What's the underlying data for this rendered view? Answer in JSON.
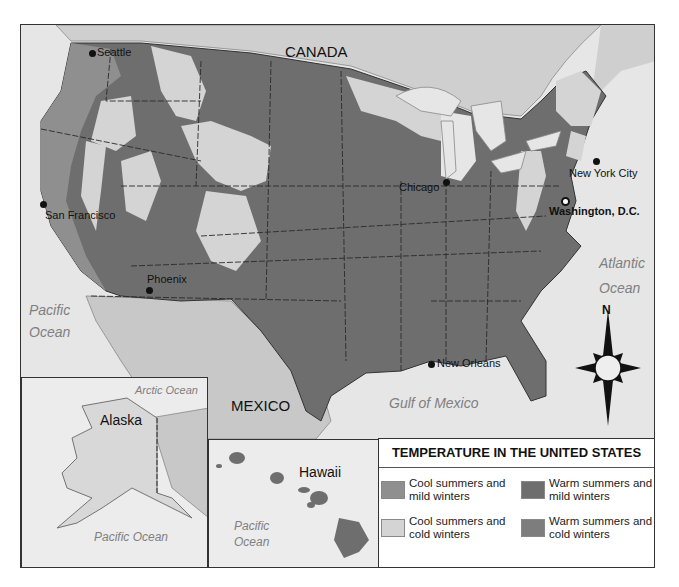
{
  "map": {
    "countries": {
      "canada": "CANADA",
      "mexico": "MEXICO"
    },
    "oceans": {
      "pacific_main": [
        "Pacific",
        "Ocean"
      ],
      "atlantic": [
        "Atlantic",
        "Ocean"
      ],
      "gulf": "Gulf of Mexico",
      "arctic_alaska": "Arctic Ocean",
      "pacific_alaska": "Pacific Ocean",
      "pacific_hawaii": [
        "Pacific",
        "Ocean"
      ]
    },
    "lakes": {
      "superior": "L. Superior",
      "michigan": "L. Michigan",
      "huron": "L. Huron",
      "erie": "L. Erie",
      "ontario": "L. Ontario"
    },
    "cities": {
      "seattle": "Seattle",
      "san_francisco": "San Francisco",
      "phoenix": "Phoenix",
      "chicago": "Chicago",
      "new_york": "New York City",
      "washington": "Washington, D.C.",
      "new_orleans": "New Orleans"
    },
    "insets": {
      "alaska": "Alaska",
      "hawaii": "Hawaii"
    },
    "compass": {
      "north": "N"
    }
  },
  "legend": {
    "title": "TEMPERATURE IN THE UNITED STATES",
    "items": [
      {
        "label": "Cool summers and mild winters",
        "color": "#8f8f8f"
      },
      {
        "label": "Warm summers and mild winters",
        "color": "#6e6e6e"
      },
      {
        "label": "Cool summers and cold winters",
        "color": "#d4d4d4"
      },
      {
        "label": "Warm summers and cold winters",
        "color": "#7d7d7d"
      }
    ]
  },
  "colors": {
    "warm_mild": "#6e6e6e",
    "warm_cold": "#7d7d7d",
    "cool_mild": "#8f8f8f",
    "cool_cold": "#d4d4d4",
    "water": "#e6e6e6",
    "foreign_land": "#c8c8c8"
  }
}
